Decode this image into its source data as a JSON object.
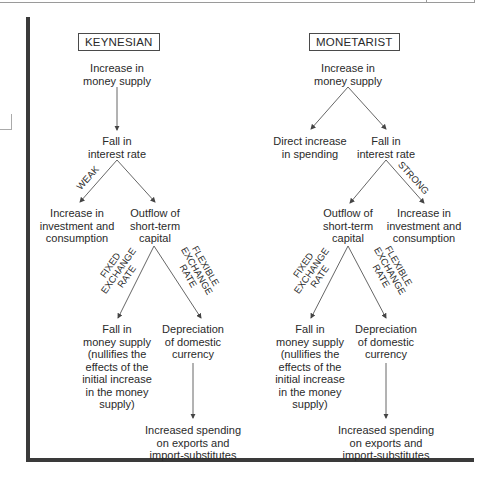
{
  "keynesian": {
    "title": "KEYNESIAN",
    "nodes": {
      "money_supply": [
        "Increase in",
        "money supply"
      ],
      "interest_rate": [
        "Fall in",
        "interest rate"
      ],
      "investment": [
        "Increase in",
        "investment and",
        "consumption"
      ],
      "outflow": [
        "Outflow of",
        "short-term",
        "capital"
      ],
      "fall_money": [
        "Fall in",
        "money supply",
        "(nullifies the",
        "effects of the",
        "initial increase",
        "in the money",
        "supply)"
      ],
      "depreciation": [
        "Depreciation",
        "of domestic",
        "currency"
      ],
      "spending": [
        "Increased spending",
        "on exports and",
        "import-substitutes"
      ]
    },
    "edge_labels": {
      "weak": "WEAK",
      "fixed": [
        "FIXED",
        "EXCHANGE",
        "RATE"
      ],
      "flexible": [
        "FLEXIBLE",
        "EXCHANGE",
        "RATE"
      ]
    }
  },
  "monetarist": {
    "title": "MONETARIST",
    "nodes": {
      "money_supply": [
        "Increase in",
        "money supply"
      ],
      "direct_spending": [
        "Direct increase",
        "in spending"
      ],
      "interest_rate": [
        "Fall in",
        "interest rate"
      ],
      "outflow": [
        "Outflow of",
        "short-term",
        "capital"
      ],
      "investment": [
        "Increase in",
        "investment and",
        "consumption"
      ],
      "fall_money": [
        "Fall in",
        "money supply",
        "(nullifies the",
        "effects of the",
        "initial increase",
        "in the money",
        "supply)"
      ],
      "depreciation": [
        "Depreciation",
        "of domestic",
        "currency"
      ],
      "spending": [
        "Increased spending",
        "on exports and",
        "import-substitutes"
      ]
    },
    "edge_labels": {
      "strong": "STRONG",
      "fixed": [
        "FIXED",
        "EXCHANGE",
        "RATE"
      ],
      "flexible": [
        "FLEXIBLE",
        "EXCHANGE",
        "RATE"
      ]
    }
  }
}
